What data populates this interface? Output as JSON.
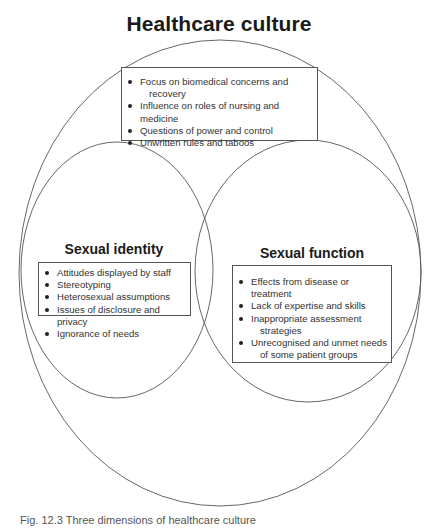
{
  "diagram": {
    "title": "Healthcare culture",
    "outer_circle": {
      "label": "Healthcare culture"
    },
    "culture_box": {
      "items": [
        {
          "text": "Focus on biomedical concerns and",
          "cont": "recovery"
        },
        {
          "text": "Influence on roles of nursing and medicine"
        },
        {
          "text": "Questions of power and control"
        },
        {
          "text": "Unwritten rules and taboos"
        }
      ]
    },
    "sexual_identity": {
      "heading": "Sexual identity",
      "items": [
        {
          "text": "Attitudes displayed by staff"
        },
        {
          "text": "Stereotyping"
        },
        {
          "text": "Heterosexual assumptions"
        },
        {
          "text": "Issues of disclosure and privacy"
        },
        {
          "text": "Ignorance of needs"
        }
      ]
    },
    "sexual_function": {
      "heading": "Sexual function",
      "items": [
        {
          "text": "Effects from disease or treatment"
        },
        {
          "text": "Lack of expertise and skills"
        },
        {
          "text": "Inappropriate assessment",
          "cont": "strategies"
        },
        {
          "text": "Unrecognised and unmet needs",
          "cont": "of some patient groups"
        }
      ]
    },
    "caption": "Fig. 12.3  Three dimensions of healthcare culture"
  },
  "colors": {
    "line": "#555555",
    "text": "#333333",
    "heading": "#1a1a1a",
    "background": "#ffffff"
  }
}
